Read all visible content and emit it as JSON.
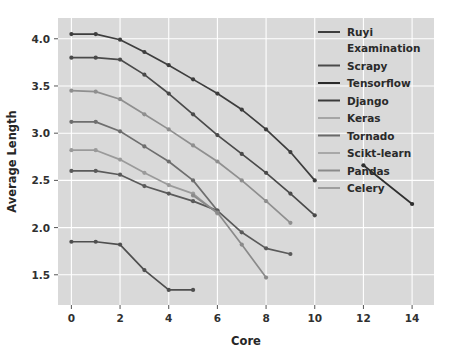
{
  "chart_data": {
    "type": "line",
    "title": "",
    "xlabel": "Core",
    "ylabel": "Average Length",
    "xlim": [
      -0.55,
      14.9
    ],
    "ylim": [
      1.18,
      4.22
    ],
    "xticks": [
      0,
      2,
      4,
      6,
      8,
      10,
      12,
      14
    ],
    "yticks": [
      1.5,
      2.0,
      2.5,
      3.0,
      3.5,
      4.0
    ],
    "xticklabels": [
      "0",
      "2",
      "4",
      "6",
      "8",
      "10",
      "12",
      "14"
    ],
    "yticklabels": [
      "1.5",
      "2.0",
      "2.5",
      "3.0",
      "3.5",
      "4.0"
    ],
    "grid": true,
    "grid_color": "#ffffff",
    "plot_bgcolor": "#d9d9d9",
    "fig_bgcolor": "#ffffff",
    "legend_position": "upper right",
    "marker": "circle",
    "series": [
      {
        "name": "Ruyi Examination",
        "color": "#3d3d3d",
        "x": [
          0,
          1,
          2,
          3,
          4,
          5,
          6,
          7,
          8,
          9,
          10
        ],
        "y": [
          4.05,
          4.05,
          3.99,
          3.86,
          3.72,
          3.57,
          3.42,
          3.25,
          3.04,
          2.8,
          2.5
        ]
      },
      {
        "name": "Scrapy",
        "color": "#4a4a4a",
        "x": [
          0,
          1,
          2,
          3,
          4,
          5,
          6,
          7,
          8,
          9,
          10
        ],
        "y": [
          3.8,
          3.8,
          3.78,
          3.62,
          3.42,
          3.2,
          2.98,
          2.78,
          2.58,
          2.36,
          2.13
        ]
      },
      {
        "name": "Tensorflow",
        "color": "#8f8f8f",
        "x": [
          0,
          1,
          2,
          3,
          4,
          5,
          6,
          7,
          8,
          9
        ],
        "y": [
          3.45,
          3.44,
          3.36,
          3.2,
          3.04,
          2.87,
          2.7,
          2.5,
          2.28,
          2.05
        ]
      },
      {
        "name": "Django",
        "color": "#6e6e6e",
        "x": [
          0,
          1,
          2,
          3,
          4,
          5,
          6
        ],
        "y": [
          3.12,
          3.12,
          3.02,
          2.86,
          2.7,
          2.5,
          2.18
        ]
      },
      {
        "name": "Keras",
        "color": "#9a9a9a",
        "x": [
          0,
          1,
          2,
          3,
          4,
          5,
          6
        ],
        "y": [
          2.82,
          2.82,
          2.72,
          2.58,
          2.45,
          2.36,
          2.15
        ]
      },
      {
        "name": "Tornado",
        "color": "#5a5a5a",
        "x": [
          0,
          1,
          2,
          3,
          4,
          5,
          6,
          7,
          8,
          9
        ],
        "y": [
          2.6,
          2.6,
          2.56,
          2.44,
          2.36,
          2.28,
          2.18,
          1.95,
          1.78,
          1.72
        ]
      },
      {
        "name": "Scikt-learn",
        "color": "#8a8a8a",
        "x": [
          5,
          6,
          7,
          8
        ],
        "y": [
          2.34,
          2.16,
          1.82,
          1.47
        ]
      },
      {
        "name": "Pandas",
        "color": "#4f4f4f",
        "x": [
          0,
          1,
          2,
          3,
          4,
          5
        ],
        "y": [
          1.85,
          1.85,
          1.82,
          1.55,
          1.34,
          1.34
        ]
      },
      {
        "name": "Celery",
        "color": "#2f2f2f",
        "x": [
          12,
          14
        ],
        "y": [
          2.66,
          2.25
        ]
      }
    ],
    "legend_entries": [
      {
        "label": "Ruyi Examination",
        "color": "#3d3d3d",
        "two_line": true,
        "line1": "Ruyi",
        "line2": "Examination"
      },
      {
        "label": "Scrapy",
        "color": "#4a4a4a"
      },
      {
        "label": "Tensorflow",
        "color": "#2a2a2a"
      },
      {
        "label": "Django",
        "color": "#3a3a3a"
      },
      {
        "label": "Keras",
        "color": "#a5a5a5"
      },
      {
        "label": "Tornado",
        "color": "#6a6a6a"
      },
      {
        "label": "Scikt-learn",
        "color": "#a8a8a8"
      },
      {
        "label": "Pandas",
        "color": "#8a8a8a"
      },
      {
        "label": "Celery",
        "color": "#9e9e9e"
      }
    ]
  }
}
